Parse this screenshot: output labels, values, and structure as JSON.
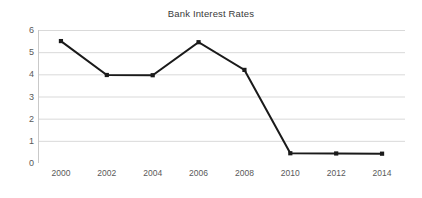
{
  "chart_data": {
    "type": "line",
    "title": "Bank Interest Rates",
    "xlabel": "",
    "ylabel": "",
    "categories": [
      "2000",
      "2002",
      "2004",
      "2006",
      "2008",
      "2010",
      "2012",
      "2014"
    ],
    "values": [
      5.5,
      3.97,
      3.96,
      5.45,
      4.2,
      0.44,
      0.43,
      0.42
    ],
    "series": [
      {
        "name": "Bank Interest Rates",
        "values": [
          5.5,
          3.97,
          3.96,
          5.45,
          4.2,
          0.44,
          0.43,
          0.42
        ]
      }
    ],
    "ylim": [
      0,
      6
    ],
    "ytick_step": 1,
    "ytick_labels": [
      "0",
      "1",
      "2",
      "3",
      "4",
      "5",
      "6"
    ],
    "xtick_labels": [
      "2000",
      "2002",
      "2004",
      "2006",
      "2008",
      "2010",
      "2012",
      "2014"
    ],
    "grid": true,
    "grid_axis": "y",
    "legend": false,
    "legend_position": "none",
    "marker": "square",
    "colors": {
      "line": "#1a1a1a",
      "marker": "#1a1a1a",
      "grid": "#d9d9d9",
      "axis": "#c9c9c9",
      "title_text": "#3a3a3a",
      "tick_text": "#595959",
      "background": "#ffffff"
    }
  }
}
